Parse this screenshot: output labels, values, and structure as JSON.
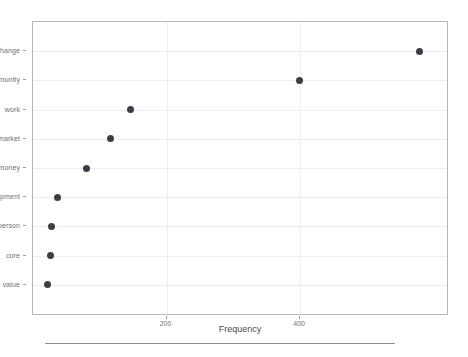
{
  "chart_data": {
    "type": "scatter",
    "title": "",
    "subtitle": "",
    "xlabel": "Frequency",
    "ylabel": "",
    "orientation": "horizontal",
    "grid": true,
    "legend": null,
    "xlim": [
      0,
      620
    ],
    "xticks": [
      200,
      400
    ],
    "xtick_labels": [
      "200",
      "400"
    ],
    "categories": [
      "value",
      "core",
      "person",
      "opment",
      "money",
      "market",
      "work",
      "mmunity",
      "change"
    ],
    "category_labels_note": "left-clipped in source image",
    "values": [
      22,
      26,
      28,
      37,
      80,
      116,
      146,
      399,
      579
    ],
    "points": [
      {
        "label": "change",
        "value": 579
      },
      {
        "label": "mmunity",
        "value": 399
      },
      {
        "label": "work",
        "value": 146
      },
      {
        "label": "market",
        "value": 116
      },
      {
        "label": "money",
        "value": 80
      },
      {
        "label": "opment",
        "value": 37
      },
      {
        "label": "person",
        "value": 28
      },
      {
        "label": "core",
        "value": 26
      },
      {
        "label": "value",
        "value": 22
      }
    ],
    "marker": {
      "shape": "circle",
      "color": "#3d3d46",
      "size": 7
    },
    "colors": {
      "marker": "#3d3d46",
      "grid": "#eceff1",
      "frame": "#b9b9b9",
      "axis_text": "#6e6e72",
      "title_text": "#4a4a4f",
      "rule": "#8d8d92",
      "background": "#ffffff"
    }
  }
}
